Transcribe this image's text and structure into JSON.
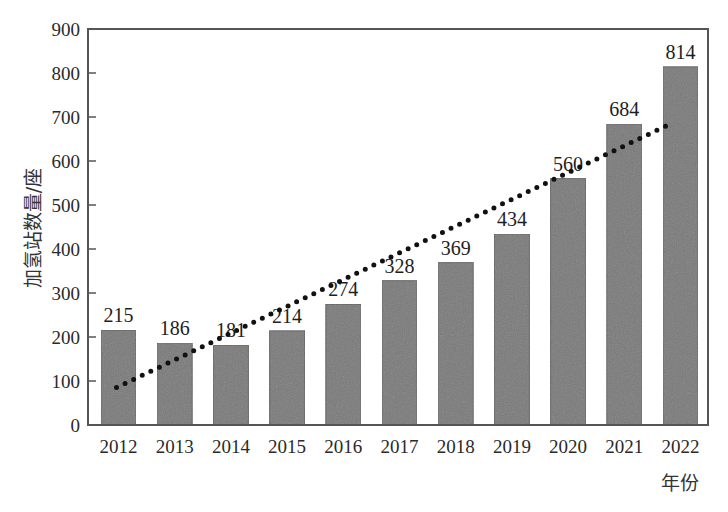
{
  "chart_data": {
    "type": "bar",
    "title": "",
    "xlabel": "年份",
    "ylabel": "加氢站数量/座",
    "categories": [
      "2012",
      "2013",
      "2014",
      "2015",
      "2016",
      "2017",
      "2018",
      "2019",
      "2020",
      "2021",
      "2022"
    ],
    "values": [
      215,
      186,
      181,
      214,
      274,
      328,
      369,
      434,
      560,
      684,
      814
    ],
    "data_labels": [
      "215",
      "186",
      "181",
      "214",
      "274",
      "328",
      "369",
      "434",
      "560",
      "684",
      "814"
    ],
    "ylim": [
      0,
      900
    ],
    "yticks": [
      0,
      100,
      200,
      300,
      400,
      500,
      600,
      700,
      800,
      900
    ],
    "grid": false,
    "legend": null,
    "trendline": {
      "type": "linear",
      "style": "dotted",
      "start": {
        "x": "2012",
        "y": 85
      },
      "end": {
        "x": "2022",
        "y": 680
      }
    },
    "colors": {
      "bar": "#7a7a7a",
      "bar_edge": "#5e5e5e",
      "trendline": "#111111",
      "axis": "#555555"
    }
  }
}
